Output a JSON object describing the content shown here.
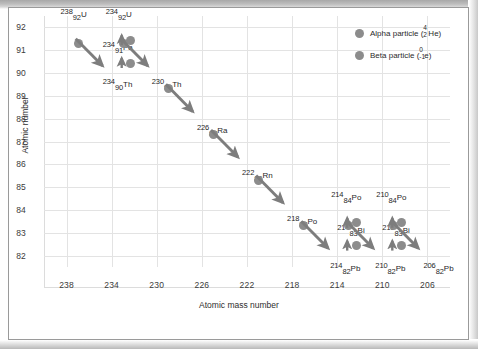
{
  "chart_data": {
    "type": "scatter",
    "title": "",
    "xlabel": "Atomic mass number",
    "ylabel": "Atomic number",
    "xlim": [
      240,
      204
    ],
    "ylim": [
      81.5,
      92.5
    ],
    "xticks": [
      238,
      234,
      230,
      226,
      222,
      218,
      214,
      210,
      206
    ],
    "yticks": [
      92,
      91,
      90,
      89,
      88,
      87,
      86,
      85,
      84,
      83,
      82
    ],
    "grid": true,
    "legend_position": "top-right",
    "series": [
      {
        "name": "Alpha particle",
        "symbol_mass": "4",
        "symbol_number": "2",
        "symbol_element": "He",
        "color": "#8c8c8c"
      },
      {
        "name": "Beta particle",
        "symbol_mass": "0",
        "symbol_number": "-1",
        "symbol_element": "e",
        "color": "#8c8c8c"
      }
    ],
    "nuclides": [
      {
        "id": "u238",
        "mass": "238",
        "number": "92",
        "symbol": "U",
        "x": 238,
        "y": 92
      },
      {
        "id": "th234",
        "mass": "234",
        "number": "90",
        "symbol": "Th",
        "x": 234,
        "y": 90
      },
      {
        "id": "pa234",
        "mass": "234",
        "number": "91",
        "symbol": "Pa",
        "x": 234,
        "y": 91
      },
      {
        "id": "u234",
        "mass": "234",
        "number": "92",
        "symbol": "U",
        "x": 234,
        "y": 92
      },
      {
        "id": "th230",
        "mass": "230",
        "number": "90",
        "symbol": "Th",
        "x": 230,
        "y": 90
      },
      {
        "id": "ra226",
        "mass": "226",
        "number": "88",
        "symbol": "Ra",
        "x": 226,
        "y": 88
      },
      {
        "id": "rn222",
        "mass": "222",
        "number": "86",
        "symbol": "Rn",
        "x": 222,
        "y": 86
      },
      {
        "id": "po218",
        "mass": "218",
        "number": "84",
        "symbol": "Po",
        "x": 218,
        "y": 84
      },
      {
        "id": "pb214",
        "mass": "214",
        "number": "82",
        "symbol": "Pb",
        "x": 214,
        "y": 82
      },
      {
        "id": "bi214",
        "mass": "214",
        "number": "83",
        "symbol": "Bi",
        "x": 214,
        "y": 83
      },
      {
        "id": "po214",
        "mass": "214",
        "number": "84",
        "symbol": "Po",
        "x": 214,
        "y": 84
      },
      {
        "id": "pb210",
        "mass": "210",
        "number": "82",
        "symbol": "Pb",
        "x": 210,
        "y": 82
      },
      {
        "id": "bi210",
        "mass": "210",
        "number": "83",
        "symbol": "Bi",
        "x": 210,
        "y": 83
      },
      {
        "id": "po210",
        "mass": "210",
        "number": "84",
        "symbol": "Po",
        "x": 210,
        "y": 84
      },
      {
        "id": "pb206",
        "mass": "206",
        "number": "82",
        "symbol": "Pb",
        "x": 206,
        "y": 82
      }
    ],
    "decays": [
      {
        "from": "u238",
        "to": "th234",
        "type": "alpha"
      },
      {
        "from": "th234",
        "to": "pa234",
        "type": "beta"
      },
      {
        "from": "pa234",
        "to": "u234",
        "type": "beta"
      },
      {
        "from": "u234",
        "to": "th230",
        "type": "alpha"
      },
      {
        "from": "th230",
        "to": "ra226",
        "type": "alpha"
      },
      {
        "from": "ra226",
        "to": "rn222",
        "type": "alpha"
      },
      {
        "from": "rn222",
        "to": "po218",
        "type": "alpha"
      },
      {
        "from": "po218",
        "to": "pb214",
        "type": "alpha"
      },
      {
        "from": "pb214",
        "to": "bi214",
        "type": "beta"
      },
      {
        "from": "bi214",
        "to": "po214",
        "type": "beta"
      },
      {
        "from": "po214",
        "to": "pb210",
        "type": "alpha"
      },
      {
        "from": "pb210",
        "to": "bi210",
        "type": "beta"
      },
      {
        "from": "bi210",
        "to": "po210",
        "type": "beta"
      },
      {
        "from": "po210",
        "to": "pb206",
        "type": "alpha"
      }
    ]
  },
  "legend": {
    "alpha": {
      "text": "Alpha particle (",
      "mass": "4",
      "number": "2",
      "element": "He",
      "close": ")"
    },
    "beta": {
      "text": "Beta particle (",
      "mass": "0",
      "number": "-1",
      "element": "e",
      "close": ")"
    }
  },
  "axes": {
    "x_title": "Atomic mass number",
    "y_title": "Atomic number",
    "x_ticks": [
      "238",
      "234",
      "230",
      "226",
      "222",
      "218",
      "214",
      "210",
      "206"
    ],
    "y_ticks": [
      "92",
      "91",
      "90",
      "89",
      "88",
      "87",
      "86",
      "85",
      "84",
      "83",
      "82"
    ]
  },
  "colors": {
    "particle": "#8c8c8c",
    "arrow": "#7d7d7d",
    "grid": "#e3e3e3",
    "text": "#1f1f1f",
    "border": "#9a9a9a"
  }
}
